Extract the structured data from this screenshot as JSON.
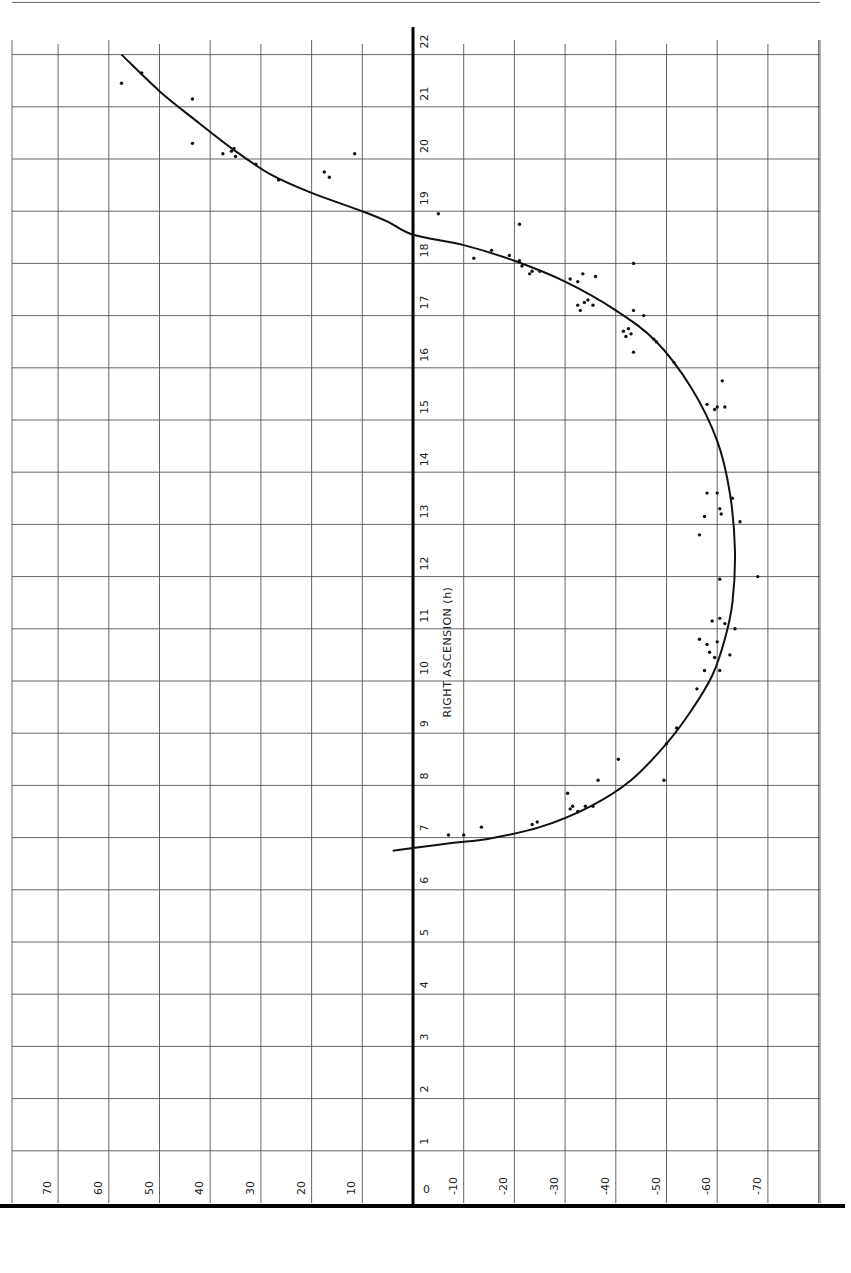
{
  "chart_data": {
    "type": "scatter",
    "title": "",
    "xlabel": "Declination (deg)",
    "ylabel": "RIGHT ASCENSION (h)",
    "orientation": "rotated 90°: declination runs horizontally (positive left, negative right), right ascension runs vertically (0 at bottom, 23 at top)",
    "xlim": [
      80,
      -80
    ],
    "ylim": [
      0,
      23.3
    ],
    "grid": true,
    "x_ticks": [
      70,
      60,
      50,
      40,
      30,
      20,
      10,
      0,
      -10,
      -20,
      -30,
      -40,
      -50,
      -60,
      -70
    ],
    "x_tick_labels": [
      "70",
      "60",
      "50",
      "40",
      "30",
      "20",
      "10",
      "0",
      "-10",
      "-20",
      "-30",
      "-40",
      "-50",
      "-60",
      "-70"
    ],
    "y_ticks": [
      1,
      2,
      3,
      4,
      5,
      6,
      7,
      8,
      9,
      10,
      11,
      12,
      13,
      14,
      15,
      16,
      17,
      18,
      19,
      20,
      21,
      22,
      23
    ],
    "y_tick_labels": [
      "1",
      "2",
      "3",
      "4",
      "5",
      "6",
      "7",
      "8",
      "9",
      "10",
      "11",
      "12",
      "13",
      "14",
      "15",
      "16",
      "17",
      "18",
      "19",
      "20",
      "21",
      "22",
      "23"
    ],
    "axis_title": "RIGHT ASCENSION (h)",
    "series": [
      {
        "name": "observations",
        "kind": "points",
        "points": [
          {
            "dec": 57.5,
            "ra": 21.45
          },
          {
            "dec": 53.5,
            "ra": 21.65
          },
          {
            "dec": 43.5,
            "ra": 21.15
          },
          {
            "dec": 43.5,
            "ra": 20.3
          },
          {
            "dec": 37.5,
            "ra": 20.1
          },
          {
            "dec": 35.8,
            "ra": 20.15
          },
          {
            "dec": 35.3,
            "ra": 20.2
          },
          {
            "dec": 35.0,
            "ra": 20.05
          },
          {
            "dec": 31.0,
            "ra": 19.9
          },
          {
            "dec": 26.5,
            "ra": 19.6
          },
          {
            "dec": 17.5,
            "ra": 19.75
          },
          {
            "dec": 16.5,
            "ra": 19.65
          },
          {
            "dec": 11.5,
            "ra": 20.1
          },
          {
            "dec": -5.0,
            "ra": 18.95
          },
          {
            "dec": -12.0,
            "ra": 18.1
          },
          {
            "dec": -15.5,
            "ra": 18.25
          },
          {
            "dec": -19.0,
            "ra": 18.15
          },
          {
            "dec": -21.0,
            "ra": 18.75
          },
          {
            "dec": -21.0,
            "ra": 18.05
          },
          {
            "dec": -21.5,
            "ra": 17.95
          },
          {
            "dec": -23.0,
            "ra": 17.8
          },
          {
            "dec": -23.5,
            "ra": 17.85
          },
          {
            "dec": -25.0,
            "ra": 17.85
          },
          {
            "dec": -31.0,
            "ra": 17.7
          },
          {
            "dec": -32.5,
            "ra": 17.65
          },
          {
            "dec": -33.5,
            "ra": 17.8
          },
          {
            "dec": -36.0,
            "ra": 17.75
          },
          {
            "dec": -32.5,
            "ra": 17.2
          },
          {
            "dec": -33.0,
            "ra": 17.1
          },
          {
            "dec": -33.8,
            "ra": 17.25
          },
          {
            "dec": -34.5,
            "ra": 17.3
          },
          {
            "dec": -35.5,
            "ra": 17.2
          },
          {
            "dec": -43.5,
            "ra": 18.0
          },
          {
            "dec": -43.5,
            "ra": 17.1
          },
          {
            "dec": -45.5,
            "ra": 17.0
          },
          {
            "dec": -41.5,
            "ra": 16.7
          },
          {
            "dec": -42.0,
            "ra": 16.6
          },
          {
            "dec": -42.5,
            "ra": 16.75
          },
          {
            "dec": -43.0,
            "ra": 16.65
          },
          {
            "dec": -43.5,
            "ra": 16.3
          },
          {
            "dec": -47.5,
            "ra": 16.55
          },
          {
            "dec": -48.0,
            "ra": 16.5
          },
          {
            "dec": -51.5,
            "ra": 16.1
          },
          {
            "dec": -58.0,
            "ra": 15.3
          },
          {
            "dec": -59.5,
            "ra": 15.2
          },
          {
            "dec": -60.0,
            "ra": 15.25
          },
          {
            "dec": -61.5,
            "ra": 15.25
          },
          {
            "dec": -61.0,
            "ra": 15.75
          },
          {
            "dec": -58.0,
            "ra": 13.6
          },
          {
            "dec": -60.0,
            "ra": 13.6
          },
          {
            "dec": -60.5,
            "ra": 13.3
          },
          {
            "dec": -60.8,
            "ra": 13.2
          },
          {
            "dec": -57.5,
            "ra": 13.15
          },
          {
            "dec": -56.5,
            "ra": 12.8
          },
          {
            "dec": -63.0,
            "ra": 13.5
          },
          {
            "dec": -64.5,
            "ra": 13.05
          },
          {
            "dec": -60.5,
            "ra": 11.95
          },
          {
            "dec": -68.0,
            "ra": 12.0
          },
          {
            "dec": -59.0,
            "ra": 11.15
          },
          {
            "dec": -60.5,
            "ra": 11.2
          },
          {
            "dec": -61.5,
            "ra": 11.1
          },
          {
            "dec": -63.5,
            "ra": 11.0
          },
          {
            "dec": -56.5,
            "ra": 10.8
          },
          {
            "dec": -58.0,
            "ra": 10.7
          },
          {
            "dec": -58.5,
            "ra": 10.55
          },
          {
            "dec": -59.5,
            "ra": 10.45
          },
          {
            "dec": -60.0,
            "ra": 10.75
          },
          {
            "dec": -62.5,
            "ra": 10.5
          },
          {
            "dec": -57.5,
            "ra": 10.2
          },
          {
            "dec": -60.5,
            "ra": 10.2
          },
          {
            "dec": -56.0,
            "ra": 9.85
          },
          {
            "dec": -52.0,
            "ra": 9.1
          },
          {
            "dec": -50.0,
            "ra": 8.8
          },
          {
            "dec": -49.5,
            "ra": 8.1
          },
          {
            "dec": -40.5,
            "ra": 8.5
          },
          {
            "dec": -36.5,
            "ra": 8.1
          },
          {
            "dec": -30.5,
            "ra": 7.85
          },
          {
            "dec": -31.0,
            "ra": 7.55
          },
          {
            "dec": -31.5,
            "ra": 7.6
          },
          {
            "dec": -32.5,
            "ra": 7.5
          },
          {
            "dec": -34.0,
            "ra": 7.6
          },
          {
            "dec": -35.5,
            "ra": 7.6
          },
          {
            "dec": -23.5,
            "ra": 7.25
          },
          {
            "dec": -24.5,
            "ra": 7.3
          },
          {
            "dec": -13.5,
            "ra": 7.2
          },
          {
            "dec": -10.0,
            "ra": 7.05
          },
          {
            "dec": -7.0,
            "ra": 7.05
          }
        ]
      },
      {
        "name": "fitted curve",
        "kind": "line",
        "points": [
          {
            "dec": 57.5,
            "ra": 22.0
          },
          {
            "dec": 50.0,
            "ra": 21.3
          },
          {
            "dec": 43.0,
            "ra": 20.75
          },
          {
            "dec": 35.0,
            "ra": 20.15
          },
          {
            "dec": 28.0,
            "ra": 19.7
          },
          {
            "dec": 20.0,
            "ra": 19.35
          },
          {
            "dec": 10.0,
            "ra": 19.0
          },
          {
            "dec": 5.0,
            "ra": 18.8
          },
          {
            "dec": 0.0,
            "ra": 18.55
          },
          {
            "dec": -10.0,
            "ra": 18.35
          },
          {
            "dec": -20.0,
            "ra": 18.05
          },
          {
            "dec": -30.0,
            "ra": 17.65
          },
          {
            "dec": -40.0,
            "ra": 17.1
          },
          {
            "dec": -48.0,
            "ra": 16.5
          },
          {
            "dec": -55.0,
            "ra": 15.6
          },
          {
            "dec": -60.0,
            "ra": 14.6
          },
          {
            "dec": -62.5,
            "ra": 13.6
          },
          {
            "dec": -63.5,
            "ra": 12.5
          },
          {
            "dec": -63.0,
            "ra": 11.5
          },
          {
            "dec": -61.5,
            "ra": 10.8
          },
          {
            "dec": -59.0,
            "ra": 10.1
          },
          {
            "dec": -55.0,
            "ra": 9.45
          },
          {
            "dec": -50.0,
            "ra": 8.8
          },
          {
            "dec": -43.0,
            "ra": 8.1
          },
          {
            "dec": -35.0,
            "ra": 7.6
          },
          {
            "dec": -25.0,
            "ra": 7.2
          },
          {
            "dec": -15.0,
            "ra": 6.98
          },
          {
            "dec": -8.0,
            "ra": 6.9
          },
          {
            "dec": 0.0,
            "ra": 6.8
          },
          {
            "dec": 4.0,
            "ra": 6.75
          }
        ]
      }
    ],
    "annotations": []
  },
  "labels": {
    "axis_title": "RIGHT ASCENSION (h)"
  }
}
